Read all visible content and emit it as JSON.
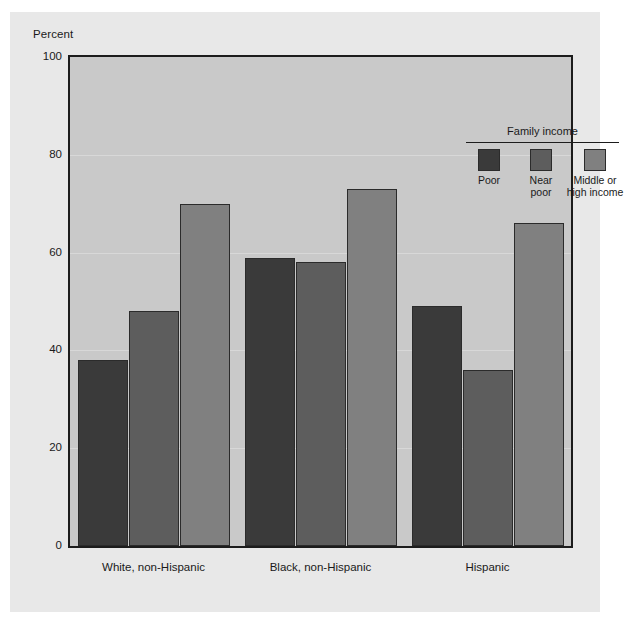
{
  "chart": {
    "type": "bar",
    "y_axis_title": "Percent",
    "background_color": "#e8e8e8",
    "plot_background_color": "#c9c9c9",
    "frame_color": "#1c1c1c"
  },
  "legend": {
    "title": "Family income",
    "position": "top-right inside plot",
    "items": [
      {
        "label": "Poor",
        "color": "#3a3a3a"
      },
      {
        "label": "Near\npoor",
        "color": "#5d5d5d"
      },
      {
        "label": "Middle or\nhigh income",
        "color": "#808080"
      }
    ]
  },
  "chart_data": {
    "type": "bar",
    "title": "",
    "subtitle": "",
    "xlabel": "",
    "ylabel": "Percent",
    "ylim": [
      0,
      100
    ],
    "yticks": [
      0,
      20,
      40,
      60,
      80,
      100
    ],
    "ytick_labels": [
      "0",
      "20",
      "40",
      "60",
      "80",
      "100"
    ],
    "grid": true,
    "legend_position": "upper right",
    "categories": [
      "White, non-Hispanic",
      "Black, non-Hispanic",
      "Hispanic"
    ],
    "series": [
      {
        "name": "Poor",
        "color": "#3a3a3a",
        "values": [
          38,
          59,
          49
        ]
      },
      {
        "name": "Near poor",
        "color": "#5d5d5d",
        "values": [
          48,
          58,
          36
        ]
      },
      {
        "name": "Middle or high income",
        "color": "#808080",
        "values": [
          70,
          73,
          66
        ]
      }
    ]
  }
}
